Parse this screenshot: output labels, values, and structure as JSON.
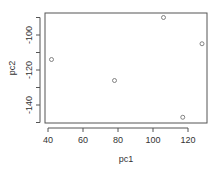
{
  "chart_data": {
    "type": "scatter",
    "title": "",
    "xlabel": "pc1",
    "ylabel": "pc2",
    "xlim": [
      38,
      131
    ],
    "ylim": [
      -152,
      -87
    ],
    "xticks": [
      40,
      60,
      80,
      100,
      120
    ],
    "yticks": [
      -140,
      -120,
      -100
    ],
    "ytick_labels": [
      "-140",
      "-120",
      "-100"
    ],
    "xtick_labels": [
      "40",
      "60",
      "80",
      "100",
      "120"
    ],
    "grid": false,
    "legend": null,
    "marker": "open-circle",
    "points": [
      {
        "x": 42,
        "y": -114
      },
      {
        "x": 78,
        "y": -126
      },
      {
        "x": 106,
        "y": -90
      },
      {
        "x": 128,
        "y": -105
      },
      {
        "x": 117,
        "y": -147
      }
    ]
  },
  "colors": {
    "axis": "#555555",
    "point": "#666666",
    "text": "#333333"
  }
}
